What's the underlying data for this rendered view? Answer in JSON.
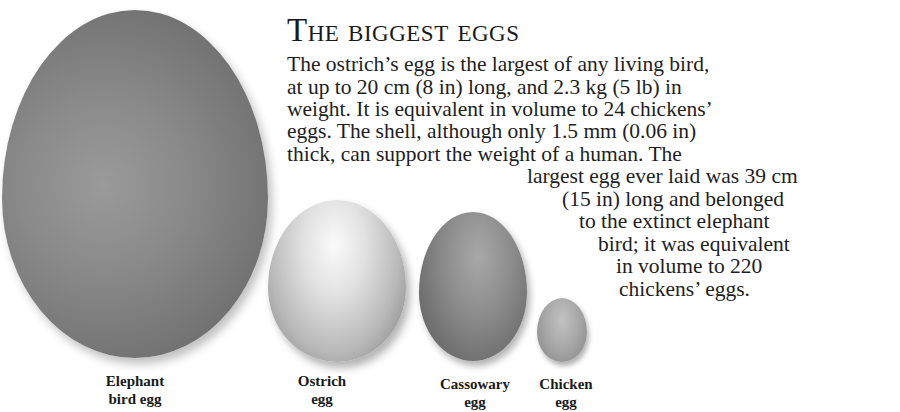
{
  "article": {
    "title": "The biggest eggs",
    "body_lines": [
      "The ostrich’s egg is the largest of any living bird,",
      "at up to 20 cm (8 in) long, and 2.3 kg (5 lb) in",
      "weight. It is equivalent in volume to 24 chickens’",
      "eggs. The shell, although only 1.5 mm (0.06 in)",
      "thick, can support the weight of a human. The",
      "largest egg ever laid was 39 cm",
      "(15 in) long and belonged",
      "to the extinct elephant",
      "bird; it was equivalent",
      "in volume to 220",
      "chickens’ eggs."
    ]
  },
  "eggs": [
    {
      "name": "elephant-bird-egg",
      "label_line1": "Elephant",
      "label_line2": "bird egg"
    },
    {
      "name": "ostrich-egg",
      "label_line1": "Ostrich",
      "label_line2": "egg"
    },
    {
      "name": "cassowary-egg",
      "label_line1": "Cassowary",
      "label_line2": "egg"
    },
    {
      "name": "chicken-egg",
      "label_line1": "Chicken",
      "label_line2": "egg"
    }
  ]
}
